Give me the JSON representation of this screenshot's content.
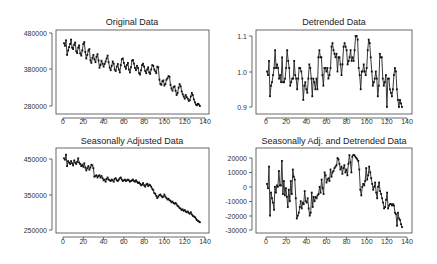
{
  "figure": {
    "panels": [
      {
        "id": "original",
        "title": "Original Data",
        "frame": {
          "x0": 56,
          "y0": 30,
          "x1": 209,
          "y1": 114
        },
        "xaxis": {
          "ticks": [
            0,
            20,
            40,
            60,
            80,
            100,
            120,
            140
          ],
          "px0": 63,
          "px140": 205,
          "label_y": 124
        },
        "yaxis": {
          "ticks": [
            480000,
            380000,
            280000
          ],
          "labels": [
            "480000",
            "380000",
            "280000"
          ],
          "py": [
            33,
            69,
            106
          ]
        },
        "yrange": [
          480000,
          280000
        ]
      },
      {
        "id": "detrended",
        "title": "Detrended Data",
        "frame": {
          "x0": 256,
          "y0": 30,
          "x1": 412,
          "y1": 114
        },
        "xaxis": {
          "ticks": [
            0,
            20,
            40,
            60,
            80,
            100,
            120,
            140
          ],
          "px0": 266,
          "px140": 407,
          "label_y": 124
        },
        "yaxis": {
          "ticks": [
            1.1,
            1.0,
            0.9
          ],
          "labels": [
            "1.1",
            "1.0",
            "0.9"
          ],
          "py": [
            36,
            72,
            107
          ]
        },
        "yrange": [
          1.1,
          0.9
        ]
      },
      {
        "id": "seasonally_adjusted",
        "title": "Seasonally Adjusted Data",
        "frame": {
          "x0": 56,
          "y0": 148,
          "x1": 209,
          "y1": 233
        },
        "xaxis": {
          "ticks": [
            0,
            20,
            40,
            60,
            80,
            100,
            120,
            140
          ],
          "px0": 63,
          "px140": 205,
          "label_y": 244
        },
        "yaxis": {
          "ticks": [
            450000,
            350000,
            250000
          ],
          "labels": [
            "450000",
            "350000",
            "250000"
          ],
          "py": [
            159,
            195,
            230
          ]
        },
        "yrange": [
          450000,
          250000
        ]
      },
      {
        "id": "sa_detrended",
        "title": "Seasonally Adj. and Detrended Data",
        "frame": {
          "x0": 256,
          "y0": 148,
          "x1": 412,
          "y1": 233
        },
        "xaxis": {
          "ticks": [
            0,
            20,
            40,
            60,
            80,
            100,
            120,
            140
          ],
          "px0": 266,
          "px140": 407,
          "label_y": 244
        },
        "yaxis": {
          "ticks": [
            20000,
            10000,
            0,
            -10000,
            -20000,
            -30000
          ],
          "labels": [
            "20000",
            "10000",
            "0",
            "-10000",
            "-20000",
            "-30000"
          ],
          "py": [
            158,
            172.5,
            187,
            201.5,
            216,
            230
          ]
        },
        "yrange": [
          20000,
          -30000
        ]
      }
    ]
  },
  "chart_data": [
    {
      "type": "line",
      "title": "Original Data",
      "xlabel": "",
      "ylabel": "",
      "xlim": [
        0,
        140
      ],
      "ylim": [
        270000,
        485000
      ],
      "x_ticks": [
        0,
        20,
        40,
        60,
        80,
        100,
        120,
        140
      ],
      "y_ticks": [
        280000,
        380000,
        480000
      ],
      "grid": false,
      "markers": true,
      "series": [
        {
          "name": "original",
          "x_start": 1,
          "x_end": 135,
          "values": [
            452000,
            445000,
            460000,
            420000,
            432000,
            441000,
            450000,
            462000,
            440000,
            436000,
            448000,
            454000,
            430000,
            425000,
            440000,
            446000,
            424000,
            418000,
            432000,
            450000,
            455000,
            428000,
            410000,
            420000,
            432000,
            436000,
            405000,
            398000,
            412000,
            420000,
            408000,
            400000,
            415000,
            422000,
            405000,
            385000,
            392000,
            404000,
            396000,
            388000,
            395000,
            402000,
            410000,
            418000,
            400000,
            385000,
            378000,
            390000,
            402000,
            396000,
            380000,
            376000,
            388000,
            395000,
            380000,
            372000,
            392000,
            408000,
            410000,
            398000,
            388000,
            382000,
            392000,
            398000,
            380000,
            372000,
            386000,
            404000,
            406000,
            396000,
            384000,
            378000,
            390000,
            384000,
            370000,
            366000,
            378000,
            392000,
            396000,
            388000,
            376000,
            370000,
            380000,
            386000,
            372000,
            368000,
            380000,
            392000,
            390000,
            380000,
            375000,
            370000,
            388000,
            386000,
            352000,
            340000,
            338000,
            348000,
            350000,
            336000,
            340000,
            352000,
            356000,
            362000,
            360000,
            338000,
            328000,
            322000,
            332000,
            334000,
            322000,
            310000,
            316000,
            330000,
            340000,
            334000,
            320000,
            312000,
            306000,
            300000,
            310000,
            304000,
            300000,
            294000,
            296000,
            306000,
            316000,
            310000,
            298000,
            290000,
            284000,
            282000,
            286000,
            284000,
            280000
          ]
        }
      ]
    },
    {
      "type": "line",
      "title": "Detrended Data",
      "xlabel": "",
      "ylabel": "",
      "xlim": [
        0,
        140
      ],
      "ylim": [
        0.89,
        1.11
      ],
      "x_ticks": [
        0,
        20,
        40,
        60,
        80,
        100,
        120,
        140
      ],
      "y_ticks": [
        0.9,
        1.0,
        1.1
      ],
      "grid": false,
      "markers": true,
      "series": [
        {
          "name": "detrended",
          "x_start": 1,
          "x_end": 135,
          "values": [
            1.0,
            0.99,
            1.03,
            0.93,
            0.96,
            0.97,
            0.99,
            1.01,
            1.06,
            1.01,
            1.02,
            1.01,
            0.98,
            0.99,
            0.97,
            1.04,
            0.97,
            0.97,
            0.98,
            1.01,
            1.06,
            1.03,
            1.01,
            0.96,
            0.97,
            0.98,
            0.98,
            1.03,
            0.99,
            0.98,
            0.95,
            0.98,
            1.01,
            1.01,
            1.0,
            0.98,
            0.92,
            0.96,
            0.97,
            0.95,
            0.94,
            0.98,
            1.02,
            1.01,
            0.98,
            0.93,
            0.98,
            0.97,
            0.95,
            0.98,
            0.95,
            1.04,
            1.06,
            1.04,
            1.04,
            0.99,
            0.96,
            1.01,
            1.01,
            1.0,
            1.01,
            0.98,
            0.99,
            1.01,
            1.07,
            1.08,
            1.06,
            1.05,
            1.04,
            1.05,
            1.0,
            1.04,
            1.04,
            1.02,
            0.99,
            1.02,
            1.07,
            1.08,
            1.07,
            1.06,
            1.02,
            1.03,
            1.04,
            1.06,
            1.03,
            1.04,
            1.03,
            1.06,
            1.1,
            1.1,
            1.09,
            1.01,
            0.99,
            0.95,
            1.0,
            1.0,
            1.02,
            1.0,
            0.99,
            1.01,
            1.06,
            1.09,
            1.08,
            1.04,
            1.0,
            0.96,
            0.97,
            0.98,
            1.0,
            0.98,
            0.93,
            0.96,
            1.05,
            1.04,
            1.04,
            0.98,
            0.96,
            0.97,
            0.99,
            0.9,
            0.98,
            0.98,
            0.95,
            0.94,
            0.93,
            0.95,
            0.99,
            1.01,
            1.0,
            0.95,
            0.92,
            0.9,
            0.92,
            0.91,
            0.9
          ]
        }
      ]
    },
    {
      "type": "line",
      "title": "Seasonally Adjusted Data",
      "xlabel": "",
      "ylabel": "",
      "xlim": [
        0,
        140
      ],
      "ylim": [
        245000,
        470000
      ],
      "x_ticks": [
        0,
        20,
        40,
        60,
        80,
        100,
        120,
        140
      ],
      "y_ticks": [
        250000,
        350000,
        450000
      ],
      "grid": false,
      "markers": true,
      "series": [
        {
          "name": "seasonally_adjusted",
          "x_start": 1,
          "x_end": 135,
          "values": [
            452000,
            448000,
            462000,
            430000,
            444000,
            440000,
            436000,
            444000,
            438000,
            432000,
            446000,
            440000,
            436000,
            442000,
            452000,
            440000,
            436000,
            430000,
            434000,
            428000,
            438000,
            426000,
            418000,
            424000,
            430000,
            420000,
            426000,
            434000,
            432000,
            424000,
            400000,
            402000,
            404000,
            398000,
            402000,
            404000,
            398000,
            402000,
            396000,
            390000,
            392000,
            386000,
            394000,
            398000,
            392000,
            390000,
            388000,
            392000,
            390000,
            386000,
            394000,
            396000,
            390000,
            388000,
            392000,
            396000,
            398000,
            392000,
            388000,
            390000,
            392000,
            388000,
            390000,
            392000,
            390000,
            386000,
            388000,
            390000,
            392000,
            388000,
            386000,
            390000,
            386000,
            382000,
            384000,
            380000,
            376000,
            378000,
            382000,
            376000,
            372000,
            378000,
            380000,
            374000,
            378000,
            376000,
            372000,
            366000,
            362000,
            354000,
            352000,
            346000,
            340000,
            344000,
            348000,
            350000,
            346000,
            342000,
            344000,
            350000,
            344000,
            340000,
            336000,
            338000,
            334000,
            332000,
            328000,
            330000,
            326000,
            324000,
            326000,
            322000,
            318000,
            316000,
            312000,
            310000,
            306000,
            308000,
            304000,
            306000,
            302000,
            300000,
            302000,
            298000,
            296000,
            300000,
            294000,
            290000,
            288000,
            286000,
            282000,
            278000,
            276000,
            274000,
            272000
          ]
        }
      ]
    },
    {
      "type": "line",
      "title": "Seasonally Adj. and Detrended Data",
      "xlabel": "",
      "ylabel": "",
      "xlim": [
        0,
        140
      ],
      "ylim": [
        -30000,
        22000
      ],
      "x_ticks": [
        0,
        20,
        40,
        60,
        80,
        100,
        120,
        140
      ],
      "y_ticks": [
        -30000,
        -20000,
        -10000,
        0,
        10000,
        20000
      ],
      "grid": false,
      "markers": true,
      "series": [
        {
          "name": "sa_detrended",
          "x_start": 1,
          "x_end": 135,
          "values": [
            2000,
            -1000,
            14000,
            -20000,
            -4000,
            -8000,
            -11000,
            -16000,
            0,
            -4000,
            1000,
            0,
            11000,
            1000,
            1000,
            18000,
            -5000,
            4000,
            -6000,
            -1000,
            -7000,
            -14000,
            -2000,
            -10000,
            4000,
            -5000,
            12000,
            7000,
            5000,
            -8000,
            -22000,
            -20000,
            -18000,
            -14000,
            -10000,
            -15000,
            -11000,
            -12000,
            -3000,
            -10000,
            -11000,
            -8000,
            -15000,
            -20000,
            -18000,
            -4000,
            -14000,
            -7000,
            -10000,
            -7000,
            -8000,
            -6000,
            -5000,
            0,
            -4000,
            5000,
            -1000,
            -5000,
            10000,
            8000,
            3000,
            5000,
            6000,
            4000,
            12000,
            7000,
            10000,
            11000,
            13000,
            14000,
            15000,
            20000,
            19000,
            16000,
            12000,
            14000,
            9000,
            13000,
            15000,
            10000,
            12000,
            8000,
            16000,
            22000,
            17000,
            10000,
            21000,
            22000,
            22000,
            21000,
            20000,
            19000,
            18000,
            12000,
            -2000,
            -6000,
            0,
            2000,
            1000,
            4000,
            13000,
            5000,
            8000,
            14000,
            10000,
            6000,
            2000,
            -2000,
            0,
            3000,
            -4000,
            -8000,
            0,
            3000,
            -3000,
            -5000,
            -8000,
            -11000,
            -15000,
            -14000,
            -9000,
            -4000,
            -15000,
            -13000,
            -12000,
            -12000,
            -13000,
            -12000,
            -13000,
            -18000,
            -19000,
            -27000,
            -18000,
            -22000,
            -23000,
            -26000,
            -28000
          ]
        }
      ]
    }
  ]
}
